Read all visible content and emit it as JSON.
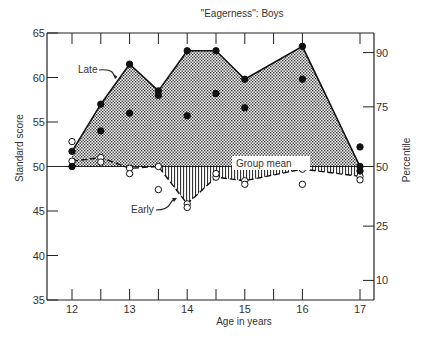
{
  "chart_data": {
    "type": "line",
    "title": "''Eagerness'': Boys",
    "xlabel": "Age in years",
    "ylabel": "Standard score",
    "y2label": "Percentile",
    "xlim": [
      11.7,
      17.45
    ],
    "ylim": [
      35,
      65
    ],
    "x_ticks": [
      12,
      13,
      14,
      15,
      16,
      17
    ],
    "x_minor_ticks": [
      12,
      12.5,
      13,
      13.5,
      14,
      14.5,
      15,
      15.5,
      16,
      17
    ],
    "y_ticks": [
      35,
      40,
      45,
      50,
      55,
      60,
      65
    ],
    "y2_ticks": [
      {
        "label": "10",
        "score": 37.2
      },
      {
        "label": "25",
        "score": 43.3
      },
      {
        "label": "50",
        "score": 50
      },
      {
        "label": "75",
        "score": 56.7
      },
      {
        "label": "90",
        "score": 62.8
      }
    ],
    "grid": false,
    "reference_line": {
      "label": "Group mean",
      "value": 50
    },
    "x": [
      12,
      12.5,
      13,
      13.5,
      14,
      14.5,
      15,
      16,
      17
    ],
    "series": [
      {
        "name": "Late",
        "marker": "filled-circle",
        "fill": "stippled",
        "values": [
          51.7,
          57.0,
          61.5,
          58.5,
          63.0,
          63.0,
          59.8,
          63.5,
          50.0
        ]
      },
      {
        "name": "Early",
        "marker": "open-circle",
        "fill": "vertical-hatch",
        "values": [
          50.6,
          51.0,
          49.8,
          50.0,
          45.8,
          48.8,
          48.4,
          49.7,
          48.9
        ]
      },
      {
        "name": "Late (other sample)",
        "marker": "filled-circle",
        "values": [
          50.0,
          54.0,
          56.0,
          58.0,
          55.7,
          58.2,
          56.6,
          59.8,
          49.5
        ]
      },
      {
        "name": "Early (other sample)",
        "marker": "open-circle",
        "values": [
          52.8,
          50.5,
          49.2,
          47.4,
          45.4,
          49.2,
          48.0,
          48.0,
          48.5
        ]
      }
    ],
    "extra_points": [
      {
        "x": 17,
        "y": 52.2,
        "marker": "filled-circle"
      }
    ],
    "annotations": [
      {
        "text": "Late",
        "points_to": {
          "x": 13,
          "y": 60
        }
      },
      {
        "text": "Early",
        "points_to": {
          "x": 13.9,
          "y": 46.5
        }
      },
      {
        "text": "Group mean",
        "at": {
          "x": 15,
          "y": 50
        }
      }
    ]
  },
  "labels": {
    "title": "''Eagerness'': Boys",
    "xlabel": "Age in years",
    "ylabel": "Standard score",
    "y2label": "Percentile",
    "late": "Late",
    "early": "Early",
    "group_mean": "Group mean"
  }
}
